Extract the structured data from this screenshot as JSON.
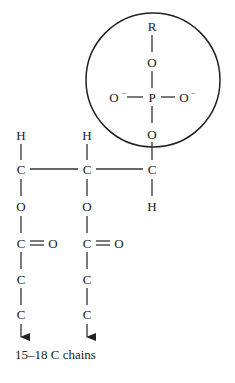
{
  "diagram": {
    "head_group": {
      "label": "phosphate head group (circled)",
      "atoms": {
        "r": "R",
        "o_top": "O",
        "p": "P",
        "o_left": "O",
        "o_right": "O",
        "o_bottom": "O",
        "charge": "−"
      }
    },
    "glycerol_backbone": {
      "left": {
        "h": "H",
        "c": "C",
        "o": "O"
      },
      "middle": {
        "h": "H",
        "c": "C",
        "o": "O"
      },
      "right": {
        "c": "C",
        "h": "H"
      }
    },
    "fatty_acid_chains": [
      {
        "carbonyl_c": "C",
        "carbonyl_o": "O",
        "c1": "C",
        "c2": "C"
      },
      {
        "carbonyl_c": "C",
        "carbonyl_o": "O",
        "c1": "C",
        "c2": "C"
      }
    ],
    "chain_label": "15–18 C chains"
  }
}
